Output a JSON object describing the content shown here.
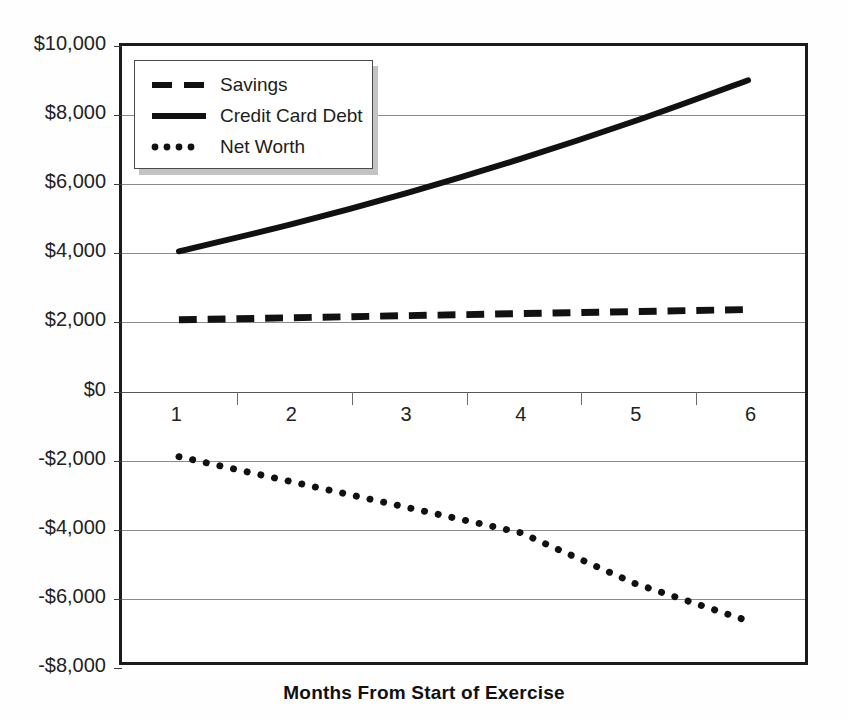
{
  "chart_data": {
    "type": "line",
    "title": "",
    "xlabel": "Months From Start of Exercise",
    "ylabel": "",
    "xlim": [
      1,
      6
    ],
    "ylim": [
      -8000,
      10000
    ],
    "grid": true,
    "legend_position": "top-left",
    "x": [
      1,
      2,
      3,
      4,
      5,
      6
    ],
    "categories": [
      "1",
      "2",
      "3",
      "4",
      "5",
      "6"
    ],
    "y_tick_labels": [
      "$10,000",
      "$8,000",
      "$6,000",
      "$4,000",
      "$2,000",
      "$0",
      "-$2,000",
      "-$4,000",
      "-$6,000",
      "-$8,000"
    ],
    "y_tick_values": [
      10000,
      8000,
      6000,
      4000,
      2000,
      0,
      -2000,
      -4000,
      -6000,
      -8000
    ],
    "x_tick_labels": [
      "1",
      "2",
      "3",
      "4",
      "5",
      "6"
    ],
    "series": [
      {
        "name": "Savings",
        "style": "dashed",
        "values": [
          2000,
          2060,
          2120,
          2180,
          2240,
          2300
        ]
      },
      {
        "name": "Credit Card Debt",
        "style": "solid",
        "values": [
          4000,
          4800,
          5700,
          6700,
          7800,
          9000
        ]
      },
      {
        "name": "Net Worth",
        "style": "dotted",
        "values": [
          -2000,
          -2740,
          -3480,
          -4220,
          -5700,
          -6800
        ]
      }
    ],
    "legend": [
      {
        "label": "Savings",
        "style": "dashed"
      },
      {
        "label": "Credit Card Debt",
        "style": "solid"
      },
      {
        "label": "Net Worth",
        "style": "dotted"
      }
    ],
    "colors": {
      "series": "#111111",
      "grid": "#8a8a8a",
      "frame": "#1b1b1b",
      "background": "#ffffff",
      "text": "#222222"
    }
  }
}
